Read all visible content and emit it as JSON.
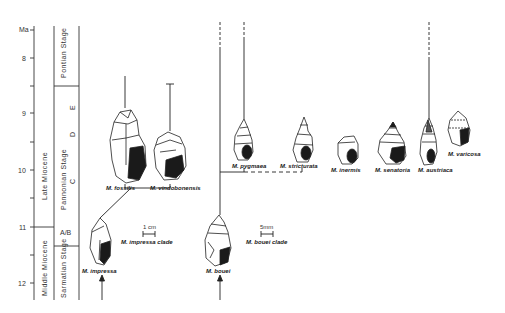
{
  "axis": {
    "unit_label": "Ma",
    "ticks": [
      {
        "label": "8",
        "y": 58
      },
      {
        "label": "9",
        "y": 113
      },
      {
        "label": "10",
        "y": 170
      },
      {
        "label": "11",
        "y": 227
      },
      {
        "label": "12",
        "y": 283
      }
    ]
  },
  "epochs": [
    {
      "label": "Late   Miocene"
    },
    {
      "label": "Middle  Miocene"
    }
  ],
  "stages": [
    {
      "label": "Pontian Stage"
    },
    {
      "label": "Pannonian Stage"
    },
    {
      "label": "Sarmatian Stage"
    }
  ],
  "zones": [
    "E",
    "D",
    "C",
    "A/B"
  ],
  "species": {
    "fossilis": "M. fossilis",
    "vindobonensis": "M. vindobonensis",
    "impressa": "M. impressa",
    "bouei": "M. bouei",
    "pygmaea": "M. pygmaea",
    "stricturata": "M. stricturata",
    "inermis": "M. inermis",
    "senatoria": "M. senatoria",
    "austriaca": "M. austriaca",
    "varicosa": "M. varicosa"
  },
  "clades": {
    "impressa": "M. impressa clade",
    "bouei": "M. bouei clade"
  },
  "scales": {
    "impressa": "1 cm",
    "bouei": "5mm"
  },
  "colors": {
    "ink": "#222222",
    "shell_dark": "#1a1a1a",
    "paper": "#ffffff"
  }
}
